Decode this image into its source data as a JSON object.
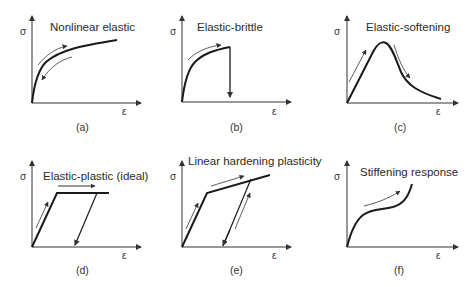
{
  "figure": {
    "panels": [
      {
        "id": "a",
        "title": "Nonlinear elastic",
        "label": "(a)",
        "y_axis": "σ",
        "x_axis": "ε"
      },
      {
        "id": "b",
        "title": "Elastic-brittle",
        "label": "(b)",
        "y_axis": "σ",
        "x_axis": "ε"
      },
      {
        "id": "c",
        "title": "Elastic-softening",
        "label": "(c)",
        "y_axis": "σ",
        "x_axis": "ε"
      },
      {
        "id": "d",
        "title": "Elastic-plastic (ideal)",
        "label": "(d)",
        "y_axis": "σ",
        "x_axis": "ε"
      },
      {
        "id": "e",
        "title": "Linear hardening plasticity",
        "label": "(e)",
        "y_axis": "σ",
        "x_axis": "ε"
      },
      {
        "id": "f",
        "title": "Stiffening response",
        "label": "(f)",
        "y_axis": "σ",
        "x_axis": "ε"
      }
    ],
    "colors": {
      "curve": "#1a1a1a",
      "arrow": "#333333",
      "axis": "#333333"
    }
  }
}
